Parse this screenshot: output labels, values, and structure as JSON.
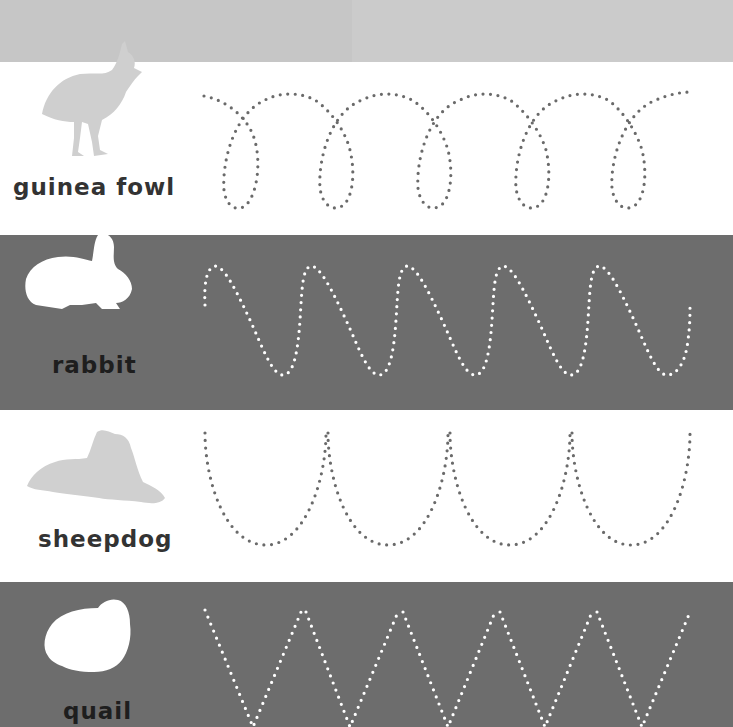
{
  "page": {
    "colors": {
      "header": "#cbcbcb",
      "white_band": "#ffffff",
      "gray_band": "#6d6d6d",
      "dots_on_white": "#6a6a6a",
      "dots_on_gray": "#ffffff",
      "silhouette_on_white": "#cfcfcf",
      "silhouette_on_gray": "#ffffff"
    }
  },
  "rows": [
    {
      "label": "guinea fowl",
      "animal_icon": "guinea-fowl-silhouette",
      "pattern": "loops",
      "band": "white"
    },
    {
      "label": "rabbit",
      "animal_icon": "rabbit-silhouette",
      "pattern": "waves",
      "band": "gray"
    },
    {
      "label": "sheepdog",
      "animal_icon": "sheepdog-silhouette",
      "pattern": "u-curves",
      "band": "white"
    },
    {
      "label": "quail",
      "animal_icon": "quail-silhouette",
      "pattern": "zigzag",
      "band": "gray"
    }
  ]
}
